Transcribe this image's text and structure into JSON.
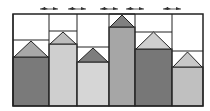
{
  "frame": {
    "x": 13,
    "y": 14,
    "width": 190,
    "height": 92,
    "stroke": "#222222"
  },
  "arrows": [
    {
      "cx": 49,
      "y": 9
    },
    {
      "cx": 77,
      "y": 9
    },
    {
      "cx": 109,
      "y": 9
    },
    {
      "cx": 135,
      "y": 9
    },
    {
      "cx": 172,
      "y": 9
    }
  ],
  "columns": [
    {
      "x0": 13,
      "x1": 49,
      "line_y": 40,
      "apex_y": 41,
      "base_y": 57,
      "body_color": "#7a7a7a",
      "roof_color": "#a8a8a8"
    },
    {
      "x0": 49,
      "x1": 77,
      "line_y": 31,
      "apex_y": 32,
      "base_y": 44,
      "body_color": "#cfcfcf",
      "roof_color": "#bdbdbd"
    },
    {
      "x0": 77,
      "x1": 109,
      "line_y": 47,
      "apex_y": 48,
      "base_y": 62,
      "body_color": "#d6d6d6",
      "roof_color": "#7d7d7d"
    },
    {
      "x0": 109,
      "x1": 135,
      "line_y": 14,
      "apex_y": 15,
      "base_y": 27,
      "body_color": "#a6a6a6",
      "roof_color": "#808080"
    },
    {
      "x0": 135,
      "x1": 172,
      "line_y": 32,
      "apex_y": 32,
      "base_y": 49,
      "body_color": "#777777",
      "roof_color": "#cfcfcf"
    },
    {
      "x0": 172,
      "x1": 203,
      "line_y": 51,
      "apex_y": 52,
      "base_y": 67,
      "body_color": "#c0c0c0",
      "roof_color": "#c8c8c8"
    }
  ]
}
